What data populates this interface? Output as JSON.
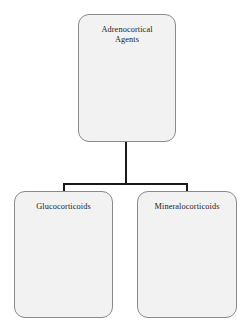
{
  "diagram": {
    "type": "hierarchy-tree",
    "colors": {
      "node_fill": "#f2f2f2",
      "node_border": "#8a8a8a",
      "connector": "#1a1a1a",
      "text": "#1c1c1c",
      "background": "#ffffff"
    },
    "root": {
      "label": "Adrenocortical Agents",
      "line1": "Adrenocortical",
      "line2": "Agents"
    },
    "children": [
      {
        "label": "Glucocorticoids"
      },
      {
        "label": "Mineralocorticoids"
      }
    ]
  }
}
